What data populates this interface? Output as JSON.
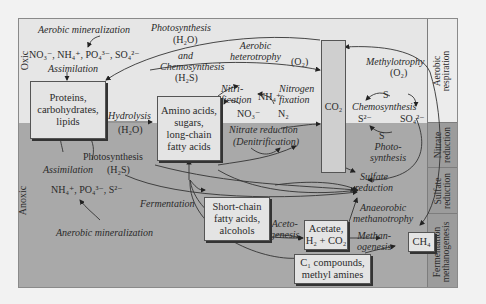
{
  "zones": {
    "oxic": "Oxic",
    "anoxic": "Anoxic"
  },
  "side_column": [
    {
      "label": "Aerobic\nrespiration"
    },
    {
      "label": "Nitrate\nreduction"
    },
    {
      "label": "Sulfate\nreduction"
    },
    {
      "label": "Fermentation\nmethanogenesis"
    }
  ],
  "boxes": {
    "proteins": "Proteins,\ncarbohydrates,\nlipids",
    "amino": "Amino acids,\nsugars,\nlong-chain\nfatty acids",
    "short_chain": "Short-chain\nfatty acids,\nalcohols",
    "acetate": "Acetate,\nH₂ + CO₂",
    "c1": "C₁ compounds,\nmethyl amines",
    "ch4": "CH₄",
    "co2": "CO₂"
  },
  "labels": {
    "aerobic_mineralization": "Aerobic mineralization",
    "oxic_nutrients": "NO₃⁻, NH₄⁺, PO₄³⁻, SO₄²⁻",
    "assimilation_oxic": "Assimilation",
    "photosynthesis_top": "Photosynthesis",
    "h2o_top": "(H₂O)",
    "and": "and",
    "chemosynthesis_top": "Chemosynthesis",
    "h2s_top": "(H₂S)",
    "aerobic_heterotrophy": "Aerobic\nheterotrophy",
    "o2_heterotrophy": "(O₂)",
    "methylotrophy": "Methylotrophy",
    "o2_methylotrophy": "(O₂)",
    "hydrolysis": "Hydrolysis",
    "h2o_hydrolysis": "(H₂O)",
    "nitrification": "Nitri-\nfication",
    "nh4": "NH₄⁺",
    "nitrogen_fixation": "Nitrogen\nfixation",
    "no3": "NO₃⁻",
    "n2": "N₂",
    "nitrate_reduction": "Nitrate reduction",
    "denitrification": "(Denitrification)",
    "s_top": "S",
    "chemosynthesis_s": "Chemosynthesis",
    "s2minus": "S²⁻",
    "so4": "SO₄²⁻",
    "s_bottom": "S",
    "photosynthesis_s": "Photo-\nsynthesis",
    "sulfate_reduction": "Sulfate\nreduction",
    "anaerobic_methanotrophy": "Anaeorobic\nmethanotrophy",
    "photosynthesis_anoxic": "Photosynthesis",
    "h2s_anoxic": "(H₂S)",
    "assimilation_anoxic": "Assimilation",
    "anoxic_nutrients": "NH₄⁺, PO₄³⁻, S²⁻",
    "anaerobic_mineralization": "Anerobic mineralization",
    "fermentation": "Fermentation",
    "acetogenesis": "Aceto-\ngenesis",
    "methanogenesis": "Methan-\nogenesis"
  },
  "colors": {
    "oxic_bg": "#e6e6e6",
    "anoxic_bg": "#a9a9a9",
    "box_bg": "#e4e4e4",
    "co2_bg": "#cfcfcf",
    "line": "#333333"
  }
}
